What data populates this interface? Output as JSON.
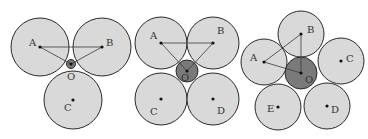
{
  "diagrams": [
    {
      "id": "three-circles",
      "big_radius": 29,
      "small": {
        "label": "O",
        "cx": 71,
        "cy": 64,
        "r": 4.5,
        "label_x": 67,
        "label_y": 80
      },
      "circles": [
        {
          "label": "A",
          "cx": 40,
          "cy": 47,
          "label_x": 29,
          "label_y": 46
        },
        {
          "label": "B",
          "cx": 102,
          "cy": 47,
          "label_x": 106,
          "label_y": 46
        },
        {
          "label": "C",
          "cx": 73,
          "cy": 100,
          "label_x": 64,
          "label_y": 111
        }
      ],
      "lines": [
        [
          "A",
          "B"
        ],
        [
          "A",
          "O"
        ],
        [
          "B",
          "O"
        ]
      ]
    },
    {
      "id": "four-circles",
      "big_radius": 26,
      "small": {
        "label": "O",
        "cx": 187,
        "cy": 71,
        "r": 11,
        "label_x": 181,
        "label_y": 81
      },
      "circles": [
        {
          "label": "A",
          "cx": 161,
          "cy": 43,
          "label_x": 150,
          "label_y": 39
        },
        {
          "label": "B",
          "cx": 213,
          "cy": 43,
          "label_x": 217,
          "label_y": 34
        },
        {
          "label": "C",
          "cx": 161,
          "cy": 99,
          "label_x": 150,
          "label_y": 115
        },
        {
          "label": "D",
          "cx": 213,
          "cy": 99,
          "label_x": 217,
          "label_y": 114
        }
      ],
      "lines": [
        [
          "A",
          "B"
        ],
        [
          "A",
          "O"
        ],
        [
          "B",
          "O"
        ]
      ]
    },
    {
      "id": "five-circles",
      "big_radius": 23,
      "small": {
        "label": "O",
        "cx": 301,
        "cy": 73,
        "r": 16,
        "label_x": 305,
        "label_y": 83
      },
      "circles": [
        {
          "label": "B",
          "cx": 301,
          "cy": 34,
          "label_x": 307,
          "label_y": 33
        },
        {
          "label": "A",
          "cx": 264,
          "cy": 62,
          "label_x": 250,
          "label_y": 61
        },
        {
          "label": "C",
          "cx": 341,
          "cy": 61,
          "label_x": 346,
          "label_y": 62
        },
        {
          "label": "E",
          "cx": 278,
          "cy": 107,
          "label_x": 267,
          "label_y": 112
        },
        {
          "label": "D",
          "cx": 327,
          "cy": 106,
          "label_x": 331,
          "label_y": 113
        }
      ],
      "lines": [
        [
          "A",
          "B"
        ],
        [
          "A",
          "O"
        ],
        [
          "B",
          "O"
        ]
      ]
    }
  ]
}
